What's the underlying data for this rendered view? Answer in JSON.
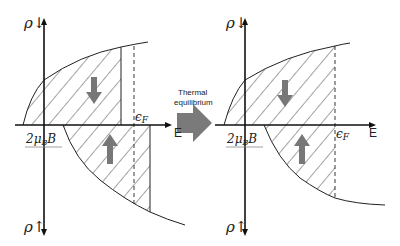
{
  "panels": {
    "left": {
      "upper_axis_label": "ρ↓",
      "lower_axis_label": "ρ↑",
      "energy_axis_label": "E",
      "shift_label": "2μ",
      "shift_label_sub": "B",
      "shift_label_tail": "B",
      "fermi_label": "ϵ",
      "fermi_label_sub": "F"
    },
    "right": {
      "upper_axis_label": "ρ↓",
      "lower_axis_label": "ρ↑",
      "energy_axis_label": "E",
      "shift_label": "2μ",
      "shift_label_sub": "B",
      "shift_label_tail": "B",
      "fermi_label": "ϵ",
      "fermi_label_sub": "F"
    }
  },
  "transition": {
    "line1": "Thermal",
    "line2": "equilibrium"
  },
  "colors": {
    "line": "#222222",
    "spin_arrow": "#777777",
    "transition_arrow": "#7a7a7a"
  }
}
